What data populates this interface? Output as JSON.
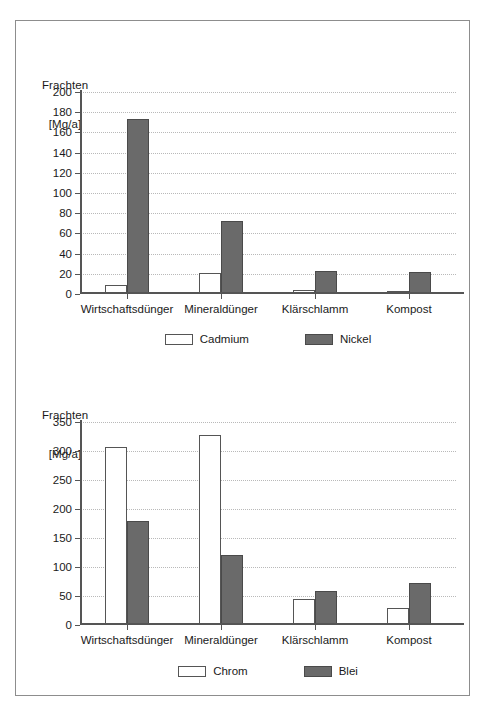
{
  "document": {
    "background_color": "#ffffff",
    "frame_color": "#8d8d8d"
  },
  "palette": {
    "light_series_fill": "#ffffff",
    "dark_series_fill": "#6a6a6a",
    "axis_color": "#555555",
    "gridline_color": "#b9b9b9",
    "text_color": "#1a1a1a"
  },
  "chart_data": [
    {
      "id": "chart-cadmium-nickel",
      "type": "bar",
      "title": "",
      "ylabel_line1": "Frachten",
      "ylabel_line2": "[Mg/a]",
      "xlabel": "",
      "categories": [
        "Wirtschaftsdünger",
        "Mineraldünger",
        "Klärschlamm",
        "Kompost"
      ],
      "series": [
        {
          "name": "Cadmium",
          "fill": "#ffffff",
          "values": [
            9,
            21,
            4,
            3
          ]
        },
        {
          "name": "Nickel",
          "fill": "#6a6a6a",
          "values": [
            173,
            72,
            23,
            22
          ]
        }
      ],
      "ylim": [
        0,
        200
      ],
      "ytick_step": 20,
      "yticks": [
        0,
        20,
        40,
        60,
        80,
        100,
        120,
        140,
        160,
        180,
        200
      ],
      "ytick_labels": [
        "0",
        "20",
        "40",
        "60",
        "80",
        "100",
        "120",
        "140",
        "160",
        "180",
        "200"
      ],
      "grid": true,
      "legend_position": "bottom"
    },
    {
      "id": "chart-chrom-blei",
      "type": "bar",
      "title": "",
      "ylabel_line1": "Frachten",
      "ylabel_line2": "[Mg/a]",
      "xlabel": "",
      "categories": [
        "Wirtschaftsdünger",
        "Mineraldünger",
        "Klärschlamm",
        "Kompost"
      ],
      "series": [
        {
          "name": "Chrom",
          "fill": "#ffffff",
          "values": [
            307,
            327,
            44,
            30
          ]
        },
        {
          "name": "Blei",
          "fill": "#6a6a6a",
          "values": [
            180,
            121,
            59,
            72
          ]
        }
      ],
      "ylim": [
        0,
        350
      ],
      "ytick_step": 50,
      "yticks": [
        0,
        50,
        100,
        150,
        200,
        250,
        300,
        350
      ],
      "ytick_labels": [
        "0",
        "50",
        "100",
        "150",
        "200",
        "250",
        "300",
        "350"
      ],
      "grid": true,
      "legend_position": "bottom"
    }
  ]
}
